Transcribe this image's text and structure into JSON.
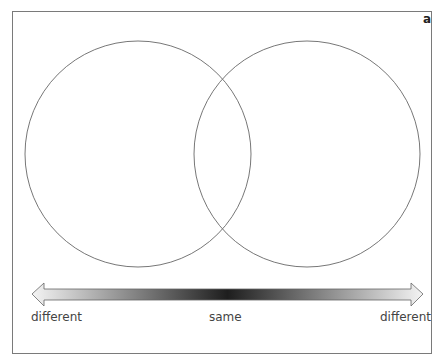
{
  "panel": {
    "label": "a"
  },
  "venn": {
    "left_circle": {
      "cx": 138,
      "cy": 154,
      "r": 113,
      "stroke": "#777777"
    },
    "right_circle": {
      "cx": 307,
      "cy": 154,
      "r": 113,
      "stroke": "#777777"
    }
  },
  "arrow": {
    "direction": "bidirectional",
    "gradient": [
      "#f4f4f4",
      "#202020",
      "#f4f4f4"
    ],
    "labels": {
      "left": "different",
      "center": "same",
      "right": "different"
    }
  }
}
